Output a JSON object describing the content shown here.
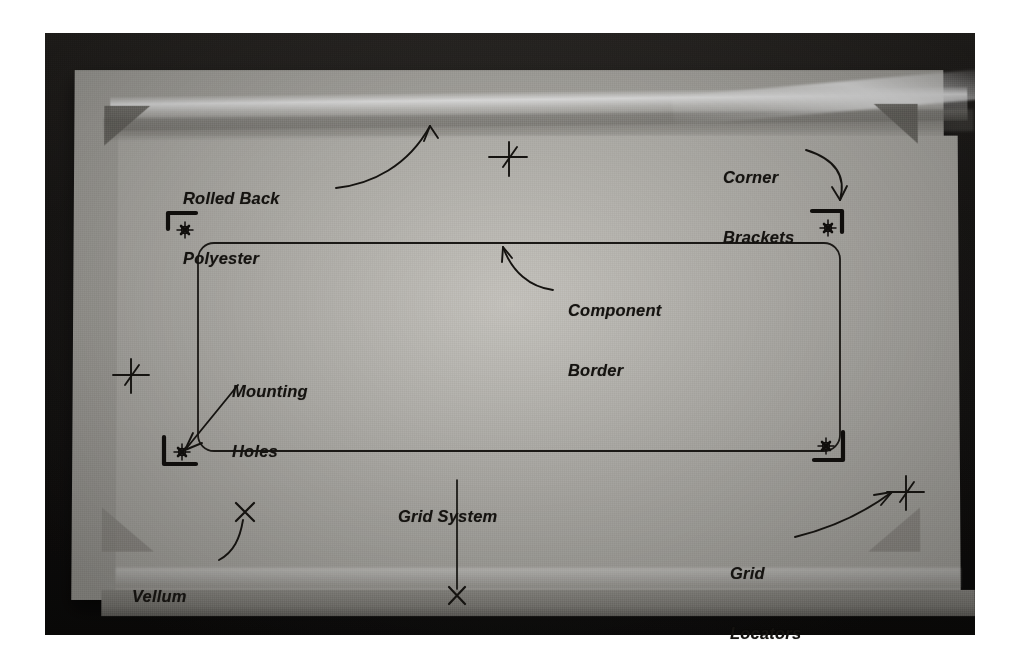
{
  "figure": {
    "kind": "annotated-photograph",
    "background_color": "#ffffff",
    "photo_border_color": "#161412",
    "board_color": "#b8b6b0",
    "vellum_color": "#c2c0ba",
    "ink_color": "#151310"
  },
  "annotations": [
    {
      "id": "rolled-back-polyester",
      "label": "Rolled Back\nPolyester",
      "line1": "Rolled Back",
      "line2": "Polyester",
      "leader": "curved-arrow",
      "points_to": "top edge of rolled polyester sheet"
    },
    {
      "id": "corner-brackets",
      "label": "Corner\nBrackets",
      "line1": "Corner",
      "line2": "Brackets",
      "leader": "curved-arrow",
      "points_to": "upper-right corner bracket mark"
    },
    {
      "id": "component-border",
      "label": "Component\nBorder",
      "line1": "Component",
      "line2": "Border",
      "leader": "curved-arrow",
      "points_to": "top edge of rounded component outline"
    },
    {
      "id": "mounting-holes",
      "label": "Mounting\nHoles",
      "line1": "Mounting",
      "line2": "Holes",
      "leader": "straight-arrow",
      "points_to": "crosshair target in lower-left corner bracket"
    },
    {
      "id": "grid-system",
      "label": "Grid System",
      "line1": "Grid System",
      "line2": "",
      "leader": "straight-line",
      "points_to": "X tick mark on lower board edge"
    },
    {
      "id": "vellum",
      "label": "Vellum",
      "line1": "Vellum",
      "line2": "",
      "leader": "curved-arrow",
      "points_to": "X mark on vellum surface"
    },
    {
      "id": "grid-locators",
      "label": "Grid\nLocators",
      "line1": "Grid",
      "line2": "Locators",
      "leader": "curved-arrow",
      "points_to": "slanted crosshair locator symbol"
    }
  ],
  "marks": {
    "corner_brackets": [
      {
        "name": "corner-bracket-top-left",
        "orientation": "top-left",
        "x": 168,
        "y": 215
      },
      {
        "name": "corner-bracket-top-right",
        "orientation": "top-right",
        "x": 828,
        "y": 213
      },
      {
        "name": "corner-bracket-bottom-left",
        "orientation": "bottom-left",
        "x": 166,
        "y": 452
      },
      {
        "name": "corner-bracket-bottom-right",
        "orientation": "bottom-right",
        "x": 826,
        "y": 448
      }
    ],
    "grid_locators": [
      {
        "name": "grid-locator-top",
        "x": 509,
        "y": 158
      },
      {
        "name": "grid-locator-left",
        "x": 131,
        "y": 375
      },
      {
        "name": "grid-locator-bottom-right",
        "x": 906,
        "y": 492
      }
    ],
    "x_marks": [
      {
        "name": "x-mark-vellum",
        "x": 245,
        "y": 512
      },
      {
        "name": "x-mark-grid-edge",
        "x": 457,
        "y": 595
      }
    ],
    "component_outline": {
      "name": "component-border-outline",
      "shape": "rounded-rectangle",
      "x": 198,
      "y": 243,
      "width": 642,
      "height": 208,
      "corner_radius": 16
    }
  }
}
